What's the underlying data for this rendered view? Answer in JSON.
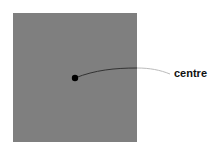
{
  "diagram": {
    "square": {
      "color": "#7f7f7f"
    },
    "point": {
      "color": "#000000"
    },
    "leader_line": {
      "inside_color": "#333333",
      "outside_color": "#bbbbbb"
    },
    "label": "centre"
  }
}
